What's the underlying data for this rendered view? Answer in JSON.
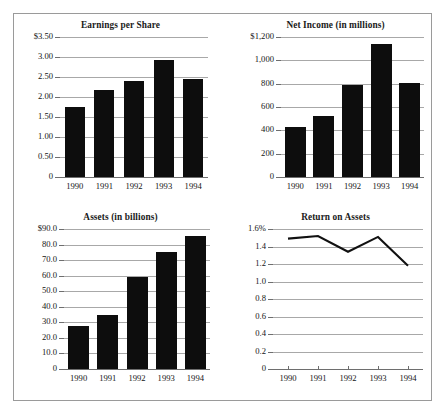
{
  "figure": {
    "name": "financial-performance-charts",
    "years": [
      "1990",
      "1991",
      "1992",
      "1993",
      "1994"
    ]
  },
  "chart_data": [
    {
      "type": "bar",
      "id": "earnings-per-share",
      "title": "Earnings per Share",
      "xlabel": "",
      "ylabel": "",
      "categories": [
        "1990",
        "1991",
        "1992",
        "1993",
        "1994"
      ],
      "values": [
        1.76,
        2.17,
        2.41,
        2.92,
        2.45
      ],
      "ylim": [
        0,
        3.5
      ],
      "yticks": [
        0,
        0.5,
        1.0,
        1.5,
        2.0,
        2.5,
        3.0,
        3.5
      ],
      "ytick_labels": [
        "0",
        "0.50",
        "1.00",
        "1.50",
        "2.00",
        "2.50",
        "3.00",
        "$3.50"
      ],
      "grid": true,
      "legend": "none",
      "bar_color": "#0d0d0d"
    },
    {
      "type": "bar",
      "id": "net-income",
      "title": "Net Income (in millions)",
      "xlabel": "",
      "ylabel": "",
      "categories": [
        "1990",
        "1991",
        "1992",
        "1993",
        "1994"
      ],
      "values": [
        425,
        525,
        785,
        1140,
        810
      ],
      "ylim": [
        0,
        1200
      ],
      "yticks": [
        0,
        200,
        400,
        600,
        800,
        1000,
        1200
      ],
      "ytick_labels": [
        "0",
        "200",
        "400",
        "600",
        "800",
        "1,000",
        "$1,200"
      ],
      "grid": true,
      "legend": "none",
      "bar_color": "#0d0d0d"
    },
    {
      "type": "bar",
      "id": "assets",
      "title": "Assets (in billions)",
      "xlabel": "",
      "ylabel": "",
      "categories": [
        "1990",
        "1991",
        "1992",
        "1993",
        "1994"
      ],
      "values": [
        27.5,
        35.0,
        59.0,
        75.2,
        85.5
      ],
      "ylim": [
        0,
        90
      ],
      "yticks": [
        0,
        10,
        20,
        30,
        40,
        50,
        60,
        70,
        80,
        90
      ],
      "ytick_labels": [
        "0",
        "10.0",
        "20.0",
        "30.0",
        "40.0",
        "50.0",
        "60.0",
        "70.0",
        "80.0",
        "$90.0"
      ],
      "grid": true,
      "legend": "none",
      "bar_color": "#0d0d0d"
    },
    {
      "type": "line",
      "id": "return-on-assets",
      "title": "Return on Assets",
      "xlabel": "",
      "ylabel": "",
      "categories": [
        "1990",
        "1991",
        "1992",
        "1993",
        "1994"
      ],
      "values": [
        1.49,
        1.52,
        1.34,
        1.51,
        1.18
      ],
      "ylim": [
        0,
        1.6
      ],
      "yticks": [
        0,
        0.2,
        0.4,
        0.6,
        0.8,
        1.0,
        1.2,
        1.4,
        1.6
      ],
      "ytick_labels": [
        "0",
        "0.2",
        "0.4",
        "0.6",
        "0.8",
        "1.0",
        "1.2",
        "1.4",
        "1.6%"
      ],
      "grid": true,
      "legend": "none",
      "line_color": "#111111"
    }
  ]
}
